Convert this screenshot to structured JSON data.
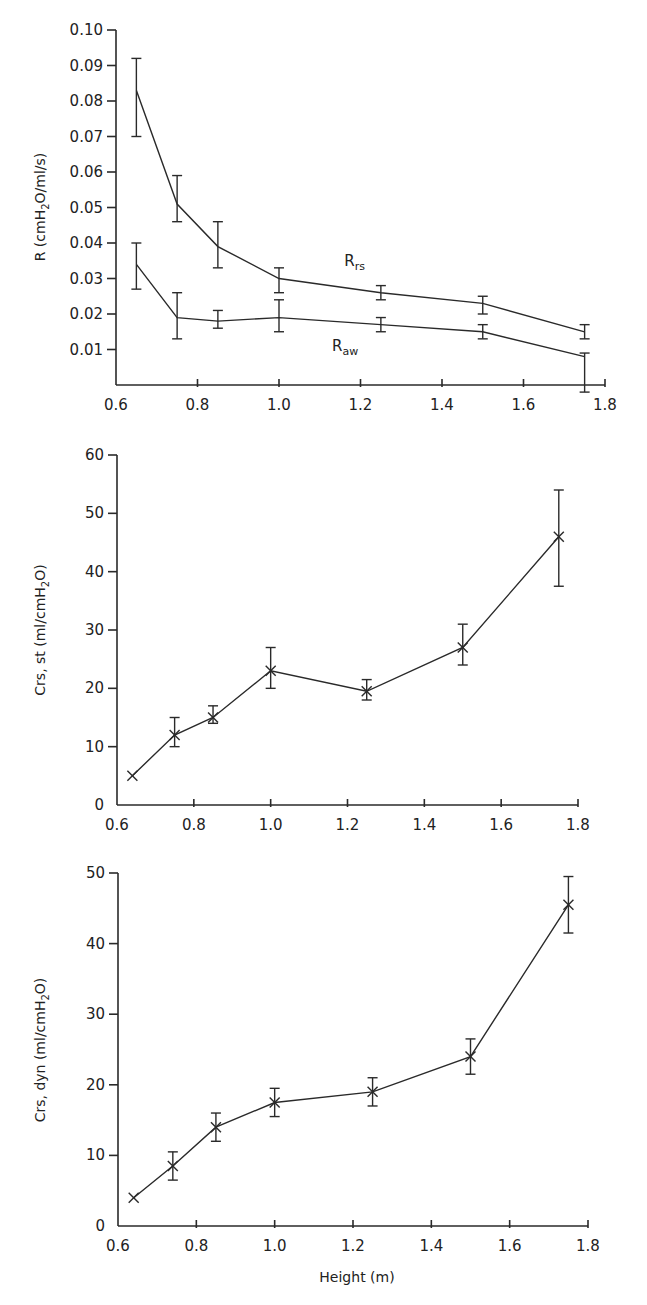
{
  "chart_data": [
    {
      "type": "line",
      "id": "resistance",
      "title": "",
      "xlabel": "",
      "ylabel": "R (cmH2O/ml/s)",
      "ylabel_parts": {
        "pre": "R (cmH",
        "sub": "2",
        "post": "O/ml/s)"
      },
      "xlim": [
        0.6,
        1.8
      ],
      "ylim": [
        0.0,
        0.1
      ],
      "xticks": [
        "0.6",
        "0.8",
        "1.0",
        "1.2",
        "1.4",
        "1.6",
        "1.8"
      ],
      "xtick_values": [
        0.6,
        0.8,
        1.0,
        1.2,
        1.4,
        1.6,
        1.8
      ],
      "yticks": [
        "0.01",
        "0.02",
        "0.03",
        "0.04",
        "0.05",
        "0.06",
        "0.07",
        "0.08",
        "0.09",
        "0.10"
      ],
      "ytick_values": [
        0.01,
        0.02,
        0.03,
        0.04,
        0.05,
        0.06,
        0.07,
        0.08,
        0.09,
        0.1
      ],
      "grid": false,
      "legend": "inline annotations",
      "series": [
        {
          "name": "Rrs",
          "label_main": "R",
          "label_sub": "rs",
          "label_pos": [
            1.16,
            0.0335
          ],
          "marker": "none",
          "x": [
            0.65,
            0.75,
            0.85,
            1.0,
            1.25,
            1.5,
            1.75
          ],
          "y": [
            0.083,
            0.051,
            0.039,
            0.03,
            0.026,
            0.023,
            0.015
          ],
          "err_low": [
            0.07,
            0.046,
            0.033,
            0.026,
            0.024,
            0.02,
            0.013
          ],
          "err_high": [
            0.092,
            0.059,
            0.046,
            0.033,
            0.028,
            0.025,
            0.017
          ]
        },
        {
          "name": "Raw",
          "label_main": "R",
          "label_sub": "aw",
          "label_pos": [
            1.13,
            0.0095
          ],
          "marker": "none",
          "x": [
            0.65,
            0.75,
            0.85,
            1.0,
            1.25,
            1.5,
            1.75
          ],
          "y": [
            0.034,
            0.019,
            0.018,
            0.019,
            0.017,
            0.015,
            0.008
          ],
          "err_low": [
            0.027,
            0.013,
            0.016,
            0.015,
            0.015,
            0.013,
            -0.002
          ],
          "err_high": [
            0.04,
            0.026,
            0.021,
            0.024,
            0.019,
            0.017,
            0.009
          ]
        }
      ]
    },
    {
      "type": "line",
      "id": "static-compliance",
      "title": "",
      "xlabel": "",
      "ylabel": "Crs, st (ml/cmH2O)",
      "ylabel_parts": {
        "pre": "Crs, st (ml/cmH",
        "sub": "2",
        "post": "O)"
      },
      "xlim": [
        0.6,
        1.8
      ],
      "ylim": [
        0,
        60
      ],
      "xticks": [
        "0.6",
        "0.8",
        "1.0",
        "1.2",
        "1.4",
        "1.6",
        "1.8"
      ],
      "xtick_values": [
        0.6,
        0.8,
        1.0,
        1.2,
        1.4,
        1.6,
        1.8
      ],
      "yticks": [
        "0",
        "10",
        "20",
        "30",
        "40",
        "50",
        "60"
      ],
      "ytick_values": [
        0,
        10,
        20,
        30,
        40,
        50,
        60
      ],
      "grid": false,
      "series": [
        {
          "name": "Crs,st",
          "marker": "x",
          "x": [
            0.64,
            0.75,
            0.85,
            1.0,
            1.25,
            1.5,
            1.75
          ],
          "y": [
            5,
            12,
            15,
            23,
            19.5,
            27,
            46
          ],
          "err_low": [
            null,
            10,
            14,
            20,
            18,
            24,
            37.5
          ],
          "err_high": [
            null,
            15,
            17,
            27,
            21.5,
            31,
            54
          ]
        }
      ]
    },
    {
      "type": "line",
      "id": "dynamic-compliance",
      "title": "",
      "xlabel": "Height (m)",
      "ylabel": "Crs, dyn (ml/cmH2O)",
      "ylabel_parts": {
        "pre": "Crs, dyn (ml/cmH",
        "sub": "2",
        "post": "O)"
      },
      "xlim": [
        0.6,
        1.8
      ],
      "ylim": [
        0,
        50
      ],
      "xticks": [
        "0.6",
        "0.8",
        "1.0",
        "1.2",
        "1.4",
        "1.6",
        "1.8"
      ],
      "xtick_values": [
        0.6,
        0.8,
        1.0,
        1.2,
        1.4,
        1.6,
        1.8
      ],
      "yticks": [
        "0",
        "10",
        "20",
        "30",
        "40",
        "50"
      ],
      "ytick_values": [
        0,
        10,
        20,
        30,
        40,
        50
      ],
      "grid": false,
      "series": [
        {
          "name": "Crs,dyn",
          "marker": "x",
          "x": [
            0.64,
            0.74,
            0.85,
            1.0,
            1.25,
            1.5,
            1.75
          ],
          "y": [
            4,
            8.5,
            14,
            17.5,
            19,
            24,
            45.5
          ],
          "err_low": [
            null,
            6.5,
            12,
            15.5,
            17,
            21.5,
            41.5
          ],
          "err_high": [
            null,
            10.5,
            16,
            19.5,
            21,
            26.5,
            49.5
          ]
        }
      ]
    }
  ],
  "colors": {
    "ink": "#2a2a2a",
    "background": "#ffffff"
  }
}
